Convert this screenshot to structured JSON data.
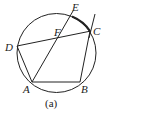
{
  "diagram": {
    "caption": "(a)",
    "points": {
      "A": "A",
      "B": "B",
      "C": "C",
      "D": "D",
      "E": "E",
      "F": "F"
    },
    "segments": [
      "AB",
      "BC",
      "AE",
      "DC",
      "DA",
      "tangent at C"
    ],
    "highlighted_arc": "EC",
    "stroke_color": "#222222"
  }
}
